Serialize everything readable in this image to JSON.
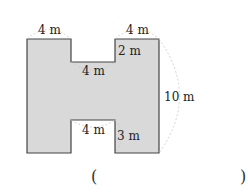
{
  "figure": {
    "shape": "H-shaped polygon (rectangle with notches at top and bottom)",
    "fill_color": "#d9d9d9",
    "stroke_color": "#444444",
    "arc_color": "#bbbbbb"
  },
  "labels": {
    "top_left_width": "4 m",
    "top_right_width": "4 m",
    "top_notch_depth": "2 m",
    "top_notch_width": "4 m",
    "height": "10 m",
    "bottom_notch_width": "4 m",
    "bottom_notch_depth": "3 m"
  },
  "answer": {
    "open_paren": "(",
    "close_paren": ")",
    "value": ""
  }
}
